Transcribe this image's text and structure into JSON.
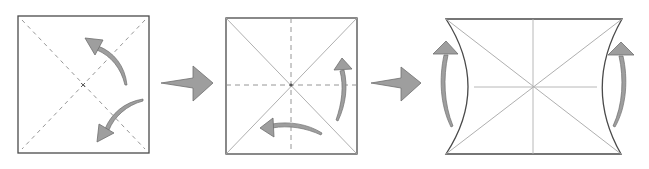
{
  "diagram": {
    "type": "origami-folding-steps",
    "steps": [
      {
        "label": "step-1",
        "shape": "square",
        "creases": [
          "diagonal-valley-1",
          "diagonal-valley-2"
        ],
        "crease_style": "dashed",
        "center_mark": "x",
        "arrows": [
          "fold-arrow-upper-left",
          "fold-arrow-lower-left"
        ]
      },
      {
        "label": "step-2",
        "shape": "square",
        "creases": [
          "diagonal-1",
          "diagonal-2",
          "vertical-dashed",
          "horizontal-dashed"
        ],
        "center_mark": "dot",
        "arrows": [
          "fold-arrow-right-up",
          "fold-arrow-bottom-left"
        ]
      },
      {
        "label": "step-3",
        "shape": "concave-sided square",
        "creases": [
          "diagonal-1",
          "diagonal-2",
          "vertical",
          "horizontal"
        ],
        "arrows": [
          "fold-arrow-left-up",
          "fold-arrow-right-up"
        ]
      }
    ],
    "transitions": [
      "step-arrow-1",
      "step-arrow-2"
    ]
  },
  "colors": {
    "outline": "#4a4a4a",
    "crease": "#9a9a9a",
    "crease_dashed": "#8a8a8a",
    "arrow_fill": "#9e9e9e",
    "arrow_stroke": "#6e6e6e",
    "background": "#ffffff"
  }
}
